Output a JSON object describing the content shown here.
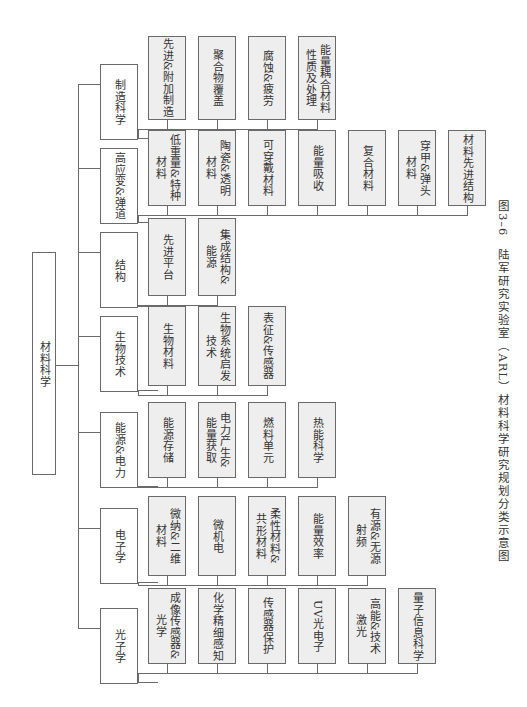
{
  "diagram": {
    "root": "材料科学",
    "categories": [
      {
        "label": "制造科学",
        "items": [
          "先进&附加制造",
          "聚合物覆盖",
          "腐蚀&疲劳",
          "能量耦合材料\n性质及处理"
        ]
      },
      {
        "label": "高应变&弹道",
        "items": [
          "低重量&特种\n材料",
          "陶瓷&透明\n材料",
          "可穿戴材料",
          "能量吸收",
          "复合材料",
          "穿甲&弹头\n材料",
          "材料先进结构"
        ]
      },
      {
        "label": "结构",
        "items": [
          "先进平台",
          "集成结构&\n能源"
        ]
      },
      {
        "label": "生物技术",
        "items": [
          "生物材料",
          "生物系统启发\n技术",
          "表征&传感器"
        ]
      },
      {
        "label": "能源&电力",
        "items": [
          "能源存储",
          "电力产生&\n能量获取",
          "燃料单元",
          "热能科学"
        ]
      },
      {
        "label": "电子学",
        "items": [
          "微纳&二维\n材料",
          "微机电",
          "柔性材料&\n共形材料",
          "能量效率",
          "有源&无源\n射频"
        ]
      },
      {
        "label": "光子学",
        "items": [
          "成像传感器&\n光学",
          "化学精细感知",
          "传感器保护",
          "UV光电子",
          "高能&技术\n激光",
          "量子信息科学"
        ]
      }
    ]
  },
  "caption": "图3–6　陆军研究实验室（ARL）材料科学研究规划分类示意图"
}
